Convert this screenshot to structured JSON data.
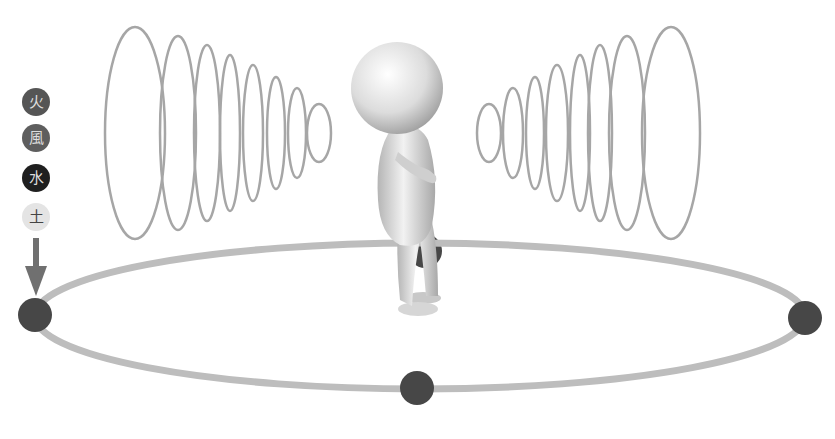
{
  "diagram": {
    "legend": {
      "items": [
        {
          "label": "火",
          "meaning": "fire",
          "bg": "#555555",
          "fg": "#dddddd",
          "cx": 36,
          "cy": 102
        },
        {
          "label": "風",
          "meaning": "wind",
          "bg": "#5e5e5e",
          "fg": "#dddddd",
          "cx": 36,
          "cy": 138
        },
        {
          "label": "水",
          "meaning": "water",
          "bg": "#1f1f1f",
          "fg": "#dddddd",
          "cx": 36,
          "cy": 178
        },
        {
          "label": "土",
          "meaning": "earth",
          "bg": "#e4e4e4",
          "fg": "#444444",
          "cx": 36,
          "cy": 217
        }
      ],
      "arrow_color": "#707070"
    },
    "orbit": {
      "cx": 420,
      "cy": 316,
      "rx": 385,
      "ry": 73,
      "stroke": "#bdbdbd",
      "dots": [
        {
          "name": "left-dot",
          "cx": 35,
          "cy": 315
        },
        {
          "name": "right-dot",
          "cx": 805,
          "cy": 318
        },
        {
          "name": "bottom-dot",
          "cx": 417,
          "cy": 388
        },
        {
          "name": "back-dot",
          "cx": 425,
          "cy": 251
        }
      ],
      "dot_color": "#474747"
    },
    "waves": {
      "stroke": "#a6a6a6",
      "left": [
        {
          "cx": 135,
          "cy": 133,
          "rx": 30,
          "ry": 106
        },
        {
          "cx": 178,
          "cy": 133,
          "rx": 18,
          "ry": 97
        },
        {
          "cx": 207,
          "cy": 133,
          "rx": 13,
          "ry": 88
        },
        {
          "cx": 230,
          "cy": 133,
          "rx": 10,
          "ry": 78
        },
        {
          "cx": 253,
          "cy": 133,
          "rx": 10,
          "ry": 68
        },
        {
          "cx": 276,
          "cy": 133,
          "rx": 9,
          "ry": 56
        },
        {
          "cx": 297,
          "cy": 133,
          "rx": 9,
          "ry": 45
        },
        {
          "cx": 319,
          "cy": 133,
          "rx": 12,
          "ry": 29
        }
      ],
      "right": [
        {
          "cx": 489,
          "cy": 133,
          "rx": 12,
          "ry": 29
        },
        {
          "cx": 513,
          "cy": 133,
          "rx": 10,
          "ry": 45
        },
        {
          "cx": 535,
          "cy": 133,
          "rx": 9,
          "ry": 56
        },
        {
          "cx": 557,
          "cy": 133,
          "rx": 11,
          "ry": 68
        },
        {
          "cx": 580,
          "cy": 133,
          "rx": 10,
          "ry": 78
        },
        {
          "cx": 600,
          "cy": 133,
          "rx": 12,
          "ry": 88
        },
        {
          "cx": 627,
          "cy": 133,
          "rx": 18,
          "ry": 97
        },
        {
          "cx": 671,
          "cy": 133,
          "rx": 29,
          "ry": 106
        }
      ]
    },
    "figure": {
      "description": "3D white stick figure standing, facing right, arms crossed"
    }
  }
}
